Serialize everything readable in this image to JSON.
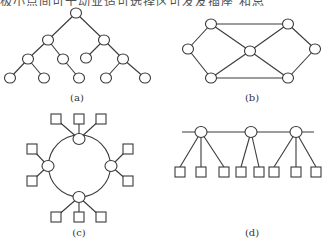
{
  "header_fragment": "极小点间可干动业适可选择区可发友插座        和总",
  "figures": [
    {
      "id": "a",
      "label": "(a)",
      "topology": "tree",
      "levels": [
        1,
        2,
        4,
        5
      ]
    },
    {
      "id": "b",
      "label": "(b)",
      "topology": "mesh",
      "node_count": 7,
      "edge_count": 10
    },
    {
      "id": "c",
      "label": "(c)",
      "topology": "ring",
      "ring_nodes": 4,
      "terminals": 10
    },
    {
      "id": "d",
      "label": "(d)",
      "topology": "bus",
      "bus_nodes": 3,
      "terminals": 8
    }
  ]
}
